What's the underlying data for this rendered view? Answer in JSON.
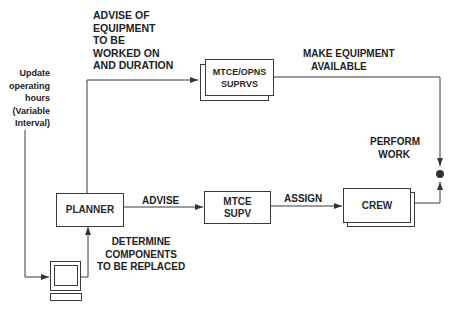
{
  "diagram": {
    "nodes": {
      "planner": "PLANNER",
      "mtce_opns": "MTCE/OPNS\nSUPRVS",
      "mtce_supv": "MTCE\nSUPV",
      "crew": "CREW"
    },
    "labels": {
      "update_hours": "Update\noperating\nhours\n(Variable\nInterval)",
      "advise_equipment": "ADVISE OF\nEQUIPMENT\nTO BE\nWORKED ON\nAND DURATION",
      "make_available": "MAKE EQUIPMENT\n   AVAILABLE",
      "perform_work": "PERFORM\n   WORK",
      "advise": "ADVISE",
      "assign": "ASSIGN",
      "determine": "DETERMINE\nCOMPONENTS\nTO BE REPLACED"
    },
    "icons": {
      "computer": "computer-terminal-icon"
    },
    "colors": {
      "line": "#3a3a3a",
      "text": "#222222",
      "background": "#ffffff"
    }
  }
}
